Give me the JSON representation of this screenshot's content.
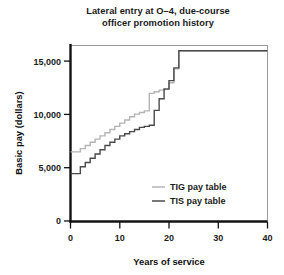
{
  "chart_data": {
    "type": "line",
    "title": "Lateral entry at O–4, due-course officer promotion history",
    "title_lines": [
      "Lateral entry at O–4, due-course",
      "officer promotion history"
    ],
    "xlabel": "Years of service",
    "ylabel": "Basic pay (dollars)",
    "xlim": [
      0,
      40
    ],
    "ylim": [
      0,
      16500
    ],
    "xticks": [
      0,
      10,
      20,
      30,
      40
    ],
    "xticklabels": [
      "0",
      "10",
      "20",
      "30",
      "40"
    ],
    "yticks": [
      0,
      5000,
      10000,
      15000
    ],
    "yticklabels": [
      "0",
      "5,000",
      "10,000",
      "15,000"
    ],
    "grid": false,
    "drawstyle": "steps-post",
    "legend_position": "lower right",
    "series": [
      {
        "name": "TIG pay table",
        "color": "#b4b4b4",
        "x": [
          0,
          1,
          2,
          3,
          4,
          5,
          6,
          7,
          8,
          9,
          10,
          11,
          12,
          13,
          14,
          15,
          16,
          17,
          18,
          19,
          20,
          21,
          22,
          40
        ],
        "y": [
          6500,
          6500,
          6800,
          7100,
          7400,
          7700,
          8000,
          8300,
          8600,
          8900,
          9200,
          9500,
          9800,
          10050,
          10200,
          10350,
          12000,
          12150,
          12300,
          12450,
          13000,
          14300,
          16000,
          16000
        ]
      },
      {
        "name": "TIS pay table",
        "color": "#4a4a4a",
        "x": [
          0,
          1,
          2,
          3,
          4,
          5,
          6,
          7,
          8,
          9,
          10,
          11,
          12,
          13,
          14,
          15,
          16,
          17,
          18,
          19,
          20,
          21,
          22,
          40
        ],
        "y": [
          4450,
          4450,
          5100,
          5500,
          5900,
          6300,
          6700,
          7100,
          7400,
          7700,
          8000,
          8200,
          8400,
          8600,
          8800,
          8900,
          9000,
          10400,
          11500,
          12400,
          13200,
          14400,
          16000,
          16000
        ]
      }
    ]
  },
  "legend": {
    "items": [
      {
        "label": "TIG pay table",
        "color": "#b4b4b4"
      },
      {
        "label": "TIS pay table",
        "color": "#4a4a4a"
      }
    ]
  },
  "style": {
    "background": "#ffffff",
    "frame_color": "#9a9a9a",
    "axis_color": "#121212",
    "text_color": "#1b1b1b",
    "tig_color": "#b4b4b4",
    "tis_color": "#4a4a4a"
  }
}
